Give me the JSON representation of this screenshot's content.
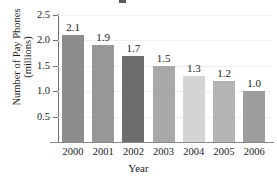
{
  "chart_data": {
    "type": "bar",
    "title": "",
    "xlabel": "Year",
    "ylabel": "Number of Pay Phones (millions)",
    "ylabel_line1": "Number of Pay Phones",
    "ylabel_line2": "(millions)",
    "categories": [
      "2000",
      "2001",
      "2002",
      "2003",
      "2004",
      "2005",
      "2006"
    ],
    "values": [
      2.1,
      1.9,
      1.7,
      1.5,
      1.3,
      1.2,
      1.0
    ],
    "value_labels": [
      "2.1",
      "1.9",
      "1.7",
      "1.5",
      "1.3",
      "1.2",
      "1.0"
    ],
    "ylim": [
      0,
      2.5
    ],
    "yticks": [
      0.5,
      1.0,
      1.5,
      2.0,
      2.5
    ],
    "ytick_labels": [
      "0.5",
      "1.0",
      "1.5",
      "2.0",
      "2.5"
    ],
    "grid": true,
    "legend": "none",
    "bar_colors": [
      "#8d8d8d",
      "#979797",
      "#6d6d6d",
      "#a8a8a8",
      "#d4d4d4",
      "#b4b4b4",
      "#9d9d9d"
    ],
    "axis_color": "#6e6e6e",
    "grid_color": "#efefef",
    "text_color": "#1a1a1a"
  }
}
